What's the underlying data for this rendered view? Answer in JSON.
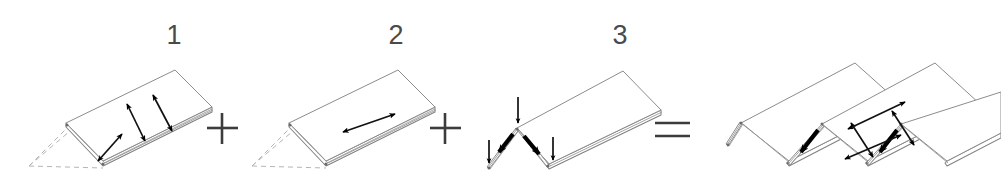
{
  "figure": {
    "background_color": "#ffffff",
    "line_color": "#8c8c8c",
    "arrow_color": "#000000",
    "construction_color": "#b5b5b5",
    "label_color": "#4a4a4a"
  },
  "panels": [
    {
      "id": "panel-1",
      "label": "1",
      "label_x": 174,
      "label_y": 44,
      "description": "flat plate with three transverse double-headed arrows",
      "arrow_count": 3,
      "arrow_kind": "double-headed",
      "arrow_direction": "transverse",
      "has_construction_lines": true
    },
    {
      "id": "panel-2",
      "label": "2",
      "label_x": 396,
      "label_y": 44,
      "description": "flat plate with one longitudinal double-headed arrow",
      "arrow_count": 1,
      "arrow_kind": "double-headed",
      "arrow_direction": "longitudinal",
      "has_construction_lines": true
    },
    {
      "id": "panel-3",
      "label": "3",
      "label_x": 620,
      "label_y": 44,
      "description": "V-folded plate with three vertical compression arrows and two thick fold arrows",
      "arrow_count": 5,
      "arrow_kind": "mixed",
      "arrow_direction": "vertical and diagonal",
      "has_construction_lines": false
    },
    {
      "id": "panel-result",
      "label": "",
      "description": "resulting corrugated accordion-folded sheet with combined arrows",
      "arrow_count": 6,
      "arrow_kind": "mixed",
      "arrow_direction": "combined",
      "has_construction_lines": false
    }
  ],
  "operators": [
    {
      "id": "operator-plus-1",
      "symbol": "+",
      "x": 222,
      "y": 128
    },
    {
      "id": "operator-plus-2",
      "symbol": "+",
      "x": 445,
      "y": 128
    },
    {
      "id": "operator-equals",
      "symbol": "=",
      "x": 672,
      "y": 129
    }
  ]
}
